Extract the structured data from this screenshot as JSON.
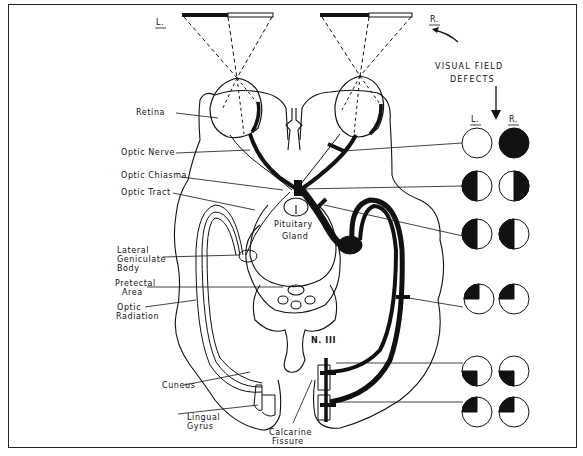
{
  "diagram": {
    "side_labels": {
      "left": "L.",
      "right": "R."
    },
    "structure_labels": [
      {
        "id": "retina",
        "text": "Retina"
      },
      {
        "id": "optic-nerve",
        "text": "Optic Nerve"
      },
      {
        "id": "optic-chiasma",
        "text": "Optic Chiasma"
      },
      {
        "id": "optic-tract",
        "text": "Optic Tract"
      },
      {
        "id": "pituitary-1",
        "text": "Pituitary"
      },
      {
        "id": "pituitary-2",
        "text": "Gland"
      },
      {
        "id": "lgb-1",
        "text": "Lateral"
      },
      {
        "id": "lgb-2",
        "text": "Geniculate"
      },
      {
        "id": "lgb-3",
        "text": "Body"
      },
      {
        "id": "pretectal-1",
        "text": "Pretectal"
      },
      {
        "id": "pretectal-2",
        "text": "Area"
      },
      {
        "id": "radiation-1",
        "text": "Optic"
      },
      {
        "id": "radiation-2",
        "text": "Radiation"
      },
      {
        "id": "nerve-iii",
        "text": "N. III"
      },
      {
        "id": "cuneus",
        "text": "Cuneus"
      },
      {
        "id": "lingual-1",
        "text": "Lingual"
      },
      {
        "id": "lingual-2",
        "text": "Gyrus"
      },
      {
        "id": "calcarine-1",
        "text": "Calcarine"
      },
      {
        "id": "calcarine-2",
        "text": "Fissure"
      }
    ],
    "defects_panel": {
      "title_line1": "VISUAL FIELD",
      "title_line2": "DEFECTS",
      "col_left": "L.",
      "col_right": "R.",
      "rows": [
        {
          "lesion": "Right optic nerve",
          "left": "normal",
          "right": "complete blindness"
        },
        {
          "lesion": "Optic chiasma",
          "left": "temporal half (left half dark)",
          "right": "temporal half (right half dark)"
        },
        {
          "lesion": "Right optic tract",
          "left": "left half dark",
          "right": "left half dark"
        },
        {
          "lesion": "Right optic radiation (temporal loop)",
          "left": "upper-left quadrant dark",
          "right": "upper-left quadrant dark"
        },
        {
          "lesion": "Right cuneus",
          "left": "lower-left quadrant dark",
          "right": "lower-left quadrant dark"
        },
        {
          "lesion": "Right lingual gyrus",
          "left": "upper-left quadrant dark",
          "right": "upper-left quadrant dark"
        }
      ]
    }
  }
}
